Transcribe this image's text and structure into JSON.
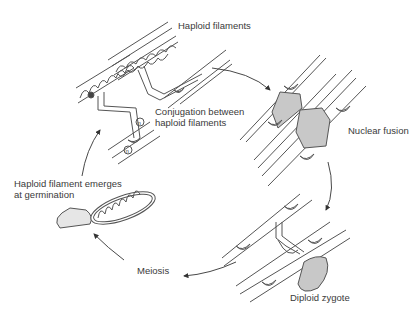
{
  "diagram": {
    "type": "life-cycle",
    "stages": [
      {
        "id": "haploid-filaments",
        "label": "Haploid filaments"
      },
      {
        "id": "conjugation",
        "label_line1": "Conjugation between",
        "label_line2": "haploid filaments",
        "marker": "n"
      },
      {
        "id": "nuclear-fusion",
        "label": "Nuclear fusion"
      },
      {
        "id": "diploid-zygote",
        "label": "Diploid zygote"
      },
      {
        "id": "meiosis",
        "label": "Meiosis"
      },
      {
        "id": "germination",
        "label_line1": "Haploid filament emerges",
        "label_line2": "at germination"
      }
    ],
    "arrows": [
      {
        "from": "haploid-filaments",
        "to": "nuclear-fusion"
      },
      {
        "from": "nuclear-fusion",
        "to": "diploid-zygote"
      },
      {
        "from": "diploid-zygote",
        "to": "meiosis"
      },
      {
        "from": "meiosis",
        "to": "germination"
      },
      {
        "from": "germination",
        "to": "haploid-filaments"
      }
    ],
    "colors": {
      "line": "#444444",
      "fill_nucleus": "#c8c8c8",
      "text": "#3a3a3a",
      "background": "#ffffff"
    }
  }
}
